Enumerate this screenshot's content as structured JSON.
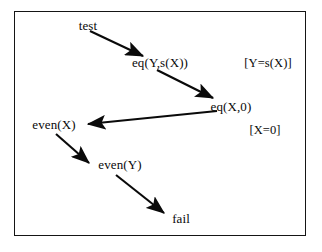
{
  "diagram": {
    "frame": {
      "border_color": "#151515",
      "background": "#ffffff"
    },
    "nodes": [
      {
        "id": "test",
        "label": "test",
        "x": 88,
        "y": 25
      },
      {
        "id": "eq_y_sx",
        "label": "eq(Y,s(X))",
        "x": 160,
        "y": 62
      },
      {
        "id": "eq_x_0",
        "label": "eq(X,0)",
        "x": 231,
        "y": 106
      },
      {
        "id": "even_x",
        "label": "even(X)",
        "x": 54,
        "y": 124
      },
      {
        "id": "even_y",
        "label": "even(Y)",
        "x": 120,
        "y": 164
      },
      {
        "id": "fail",
        "label": "fail",
        "x": 181,
        "y": 218
      }
    ],
    "annotations": [
      {
        "id": "subst_y",
        "label": "[Y=s(X)]",
        "x": 268,
        "y": 63
      },
      {
        "id": "subst_x",
        "label": "[X=0]",
        "x": 265,
        "y": 130
      }
    ],
    "edges": [
      {
        "id": "test-to-eq-y-sx",
        "from": "test",
        "to": "eq_y_sx",
        "x1": 90,
        "y1": 31,
        "x2": 143,
        "y2": 56
      },
      {
        "id": "eq-y-sx-to-eq-x-0",
        "from": "eq_y_sx",
        "to": "eq_x_0",
        "x1": 157,
        "y1": 70,
        "x2": 213,
        "y2": 98
      },
      {
        "id": "eq-x-0-to-even-x",
        "from": "eq_x_0",
        "to": "even_x",
        "x1": 217,
        "y1": 111,
        "x2": 88,
        "y2": 124
      },
      {
        "id": "even-x-to-even-y",
        "from": "even_x",
        "to": "even_y",
        "x1": 56,
        "y1": 134,
        "x2": 89,
        "y2": 163
      },
      {
        "id": "even-y-to-fail",
        "from": "even_y",
        "to": "fail",
        "x1": 116,
        "y1": 175,
        "x2": 164,
        "y2": 213
      }
    ],
    "edge_color": "#0a0a0a"
  }
}
